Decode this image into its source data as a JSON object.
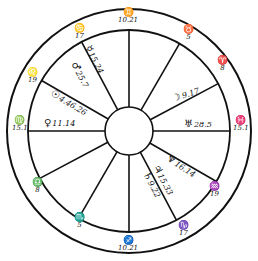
{
  "chart_type": "natal horoscope wheel",
  "geometry": {
    "cx": 129,
    "cy": 131,
    "r_outer": 122,
    "r_middle": 101,
    "r_inner": 24
  },
  "house_cusps": [
    {
      "id": "mc",
      "sign": "Gemini",
      "glyph": "♊",
      "degree": "10.21",
      "x": 118,
      "y": 8
    },
    {
      "id": "h11",
      "sign": "Cancer",
      "glyph": "♋",
      "degree": "17",
      "x": 74,
      "y": 24
    },
    {
      "id": "h12",
      "sign": "Leo",
      "glyph": "♌",
      "degree": "19",
      "x": 27,
      "y": 68
    },
    {
      "id": "asc",
      "sign": "Virgo",
      "glyph": "♍",
      "degree": "15.1",
      "x": 12,
      "y": 116
    },
    {
      "id": "h2",
      "sign": "Libra",
      "glyph": "♎",
      "degree": "8",
      "x": 32,
      "y": 178
    },
    {
      "id": "h3",
      "sign": "Scorpio",
      "glyph": "♏",
      "degree": "5",
      "x": 74,
      "y": 213
    },
    {
      "id": "ic",
      "sign": "Sagittarius",
      "glyph": "♐",
      "degree": "10.21",
      "x": 118,
      "y": 236
    },
    {
      "id": "h5",
      "sign": "Capricorn",
      "glyph": "♑",
      "degree": "17",
      "x": 178,
      "y": 221
    },
    {
      "id": "h6",
      "sign": "Aquarius",
      "glyph": "♒",
      "degree": "19",
      "x": 209,
      "y": 182
    },
    {
      "id": "dsc",
      "sign": "Pisces",
      "glyph": "♓",
      "degree": "15.1",
      "x": 233,
      "y": 116
    },
    {
      "id": "h8",
      "sign": "Aries",
      "glyph": "♈",
      "degree": "8",
      "x": 217,
      "y": 56
    },
    {
      "id": "h9",
      "sign": "Taurus",
      "glyph": "♉",
      "degree": "5",
      "x": 183,
      "y": 25
    }
  ],
  "planets": [
    {
      "name": "Mercury",
      "glyph": "☿",
      "position": "15.24",
      "x": 92,
      "y": 44,
      "rotate": 62
    },
    {
      "name": "Mars",
      "glyph": "♂",
      "position": "25.7",
      "x": 78,
      "y": 60,
      "rotate": 62
    },
    {
      "name": "Sun",
      "glyph": "☉",
      "position": "4.46.26",
      "x": 54,
      "y": 88,
      "rotate": 31
    },
    {
      "name": "Venus",
      "glyph": "♀",
      "position": "11.14",
      "x": 44,
      "y": 118,
      "rotate": 0
    },
    {
      "name": "Moon",
      "glyph": "☽",
      "position": "9.17",
      "x": 171,
      "y": 94,
      "rotate": -18
    },
    {
      "name": "Uranus",
      "glyph": "♅",
      "position": "28.5",
      "x": 184,
      "y": 119,
      "rotate": 0
    },
    {
      "name": "Neptune",
      "glyph": "♆",
      "position": "16.14",
      "x": 170,
      "y": 153,
      "rotate": 33
    },
    {
      "name": "Jupiter",
      "glyph": "♃",
      "position": "15.33",
      "x": 160,
      "y": 163,
      "rotate": 62
    },
    {
      "name": "Saturn",
      "glyph": "♄",
      "position": "9.22",
      "x": 150,
      "y": 170,
      "rotate": 62
    }
  ]
}
